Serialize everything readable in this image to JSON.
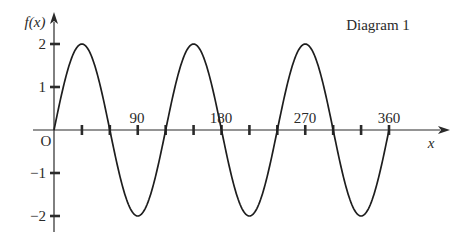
{
  "chart_data": {
    "type": "line",
    "title": "Diagram 1",
    "xlabel": "x",
    "ylabel": "f(x)",
    "function": "f(x) = 2 sin(3x)",
    "xlim": [
      0,
      360
    ],
    "ylim": [
      -2,
      2
    ],
    "x_tick_labels": [
      "90",
      "180",
      "270",
      "360"
    ],
    "x_tick_values": [
      30,
      60,
      90,
      120,
      150,
      180,
      210,
      240,
      270,
      300,
      330,
      360
    ],
    "y_tick_labels": [
      "2",
      "1",
      "-1",
      "-2"
    ],
    "y_tick_values": [
      2,
      1,
      -1,
      -2
    ],
    "origin_label": "O",
    "grid": false,
    "legend": null,
    "series": [
      {
        "name": "f(x)",
        "x": [
          0,
          30,
          60,
          90,
          120,
          150,
          180,
          210,
          240,
          270,
          300,
          330,
          360
        ],
        "values": [
          0,
          2,
          0,
          -2,
          0,
          2,
          0,
          -2,
          0,
          2,
          0,
          -2,
          0
        ]
      }
    ]
  },
  "labels": {
    "title": "Diagram 1",
    "y_axis": "f(x)",
    "x_axis": "x",
    "origin": "O",
    "x_ticks": [
      "90",
      "180",
      "270",
      "360"
    ],
    "y_ticks": [
      "2",
      "1",
      "−1",
      "−2"
    ]
  }
}
